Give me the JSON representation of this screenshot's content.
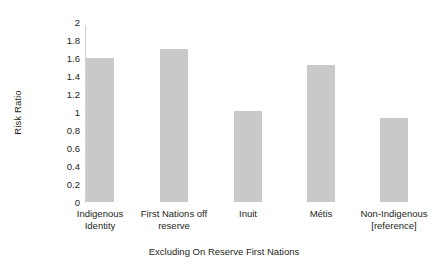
{
  "chart_data": {
    "type": "bar",
    "title": "",
    "xlabel": "Excluding On Reserve First Nations",
    "ylabel": "Risk Ratio",
    "categories": [
      "Indigenous Identity",
      "First Nations off reserve",
      "Inuit",
      "Métis",
      "Non-Indigenous [reference]"
    ],
    "category_lines": [
      [
        "Indigenous",
        "Identity"
      ],
      [
        "First Nations off",
        "reserve"
      ],
      [
        "Inuit",
        ""
      ],
      [
        "Métis",
        ""
      ],
      [
        "Non-Indigenous",
        "[reference]"
      ]
    ],
    "values": [
      1.6,
      1.7,
      1.01,
      1.52,
      0.93
    ],
    "ylim": [
      0,
      2
    ],
    "ytick_values": [
      0,
      0.2,
      0.4,
      0.6,
      0.8,
      1,
      1.2,
      1.4,
      1.6,
      1.8,
      2
    ],
    "ytick_labels": [
      "0",
      "0.2",
      "0.4",
      "0.6",
      "0.8",
      "1",
      "1.2",
      "1.4",
      "1.6",
      "1.8",
      "2"
    ],
    "grid": false,
    "legend": null,
    "bar_color": "#c9c9c9",
    "axis_color": "#d2d2d2",
    "text_color": "#231f20"
  }
}
